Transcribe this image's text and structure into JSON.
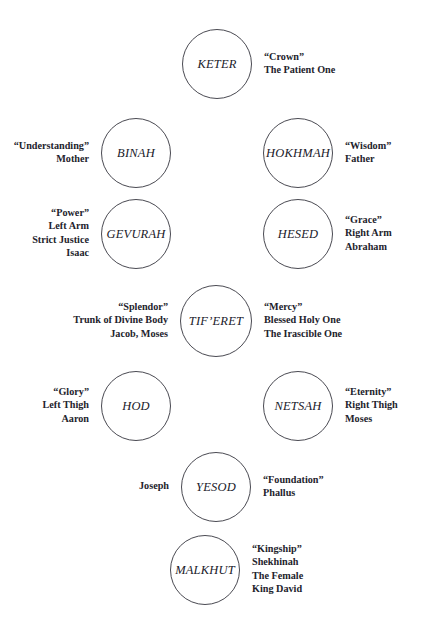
{
  "diagram": {
    "background_color": "#ffffff",
    "circle_stroke_color": "#4a4a52",
    "text_color": "#23232c",
    "nodes": [
      {
        "id": "keter",
        "name": "KETER",
        "cx": 217,
        "cy": 64,
        "r": 35,
        "left_gloss": [],
        "right_gloss": [
          "“Crown”",
          "The Patient One"
        ]
      },
      {
        "id": "binah",
        "name": "BINAH",
        "cx": 136,
        "cy": 153,
        "r": 35,
        "left_gloss": [
          "“Understanding”",
          "Mother"
        ],
        "right_gloss": []
      },
      {
        "id": "hokhmah",
        "name": "HOKHMAH",
        "cx": 298,
        "cy": 153,
        "r": 35,
        "left_gloss": [],
        "right_gloss": [
          "“Wisdom”",
          "Father"
        ]
      },
      {
        "id": "gevurah",
        "name": "GEVURAH",
        "cx": 136,
        "cy": 234,
        "r": 35,
        "left_gloss": [
          "“Power”",
          "Left Arm",
          "Strict Justice",
          "Isaac"
        ],
        "right_gloss": []
      },
      {
        "id": "hesed",
        "name": "HESED",
        "cx": 298,
        "cy": 234,
        "r": 35,
        "left_gloss": [],
        "right_gloss": [
          "“Grace”",
          "Right Arm",
          "Abraham"
        ]
      },
      {
        "id": "tiferet",
        "name": "TIF’ERET",
        "cx": 216,
        "cy": 321,
        "r": 36,
        "left_gloss": [
          "“Splendor”",
          "Trunk of Divine Body",
          "Jacob, Moses"
        ],
        "right_gloss": [
          "“Mercy”",
          "Blessed Holy One",
          "The Irascible One"
        ]
      },
      {
        "id": "hod",
        "name": "HOD",
        "cx": 136,
        "cy": 406,
        "r": 35,
        "left_gloss": [
          "“Glory”",
          "Left Thigh",
          "Aaron"
        ],
        "right_gloss": []
      },
      {
        "id": "netsah",
        "name": "NETSAH",
        "cx": 298,
        "cy": 406,
        "r": 35,
        "left_gloss": [],
        "right_gloss": [
          "“Eternity”",
          "Right Thigh",
          "Moses"
        ]
      },
      {
        "id": "yesod",
        "name": "YESOD",
        "cx": 216,
        "cy": 487,
        "r": 35,
        "left_gloss": [
          "Joseph"
        ],
        "right_gloss": [
          "“Foundation”",
          "Phallus"
        ]
      },
      {
        "id": "malkhut",
        "name": "MALKHUT",
        "cx": 205,
        "cy": 570,
        "r": 35,
        "left_gloss": [],
        "right_gloss": [
          "“Kingship”",
          "Shekhinah",
          "The Female",
          "King David"
        ]
      }
    ]
  }
}
